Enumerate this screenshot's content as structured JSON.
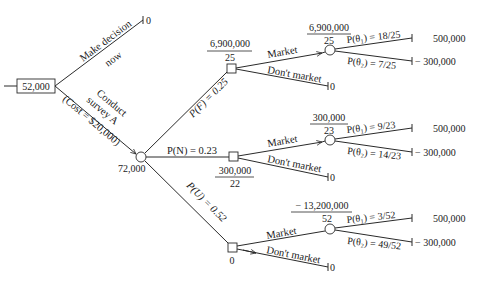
{
  "diagram": {
    "type": "decision-tree",
    "root": {
      "value": "52,000"
    },
    "make_decision_now": {
      "label_line1": "Make decision",
      "label_line2": "now",
      "payoff": "0"
    },
    "conduct_survey": {
      "label_line1": "Conduct",
      "label_line2": "survey A",
      "label_line3": "(Cost = $20,000)",
      "node_value": "72,000"
    },
    "branches": [
      {
        "prob_label": "P(F) = 0.25",
        "decision_value_num": "6,900,000",
        "decision_value_den": "25",
        "market_label": "Market",
        "dont_market_label": "Don't market",
        "dont_market_payoff": "0",
        "chance_value_num": "6,900,000",
        "chance_value_den": "25",
        "theta1_label": "P(θ₁) = 18/25",
        "theta2_label": "P(θ₂) = 7/25",
        "payoff1": "500,000",
        "payoff2": "− 300,000"
      },
      {
        "prob_label": "P(N) = 0.23",
        "decision_value_num": "300,000",
        "decision_value_den": "22",
        "market_label": "Market",
        "dont_market_label": "Don't market",
        "dont_market_payoff": "0",
        "chance_value_num": "300,000",
        "chance_value_den": "23",
        "theta1_label": "P(θ₁) = 9/23",
        "theta2_label": "P(θ₂) = 14/23",
        "payoff1": "500,000",
        "payoff2": "− 300,000"
      },
      {
        "prob_label": "P(U) = 0.52",
        "decision_value": "0",
        "market_label": "Market",
        "dont_market_label": "Don't market",
        "dont_market_payoff": "0",
        "chance_value_num": "− 13,200,000",
        "chance_value_den": "52",
        "theta1_label": "P(θ₁) = 3/52",
        "theta2_label": "P(θ₂) = 49/52",
        "payoff1": "500,000",
        "payoff2": "− 300,000"
      }
    ]
  },
  "colors": {
    "line": "#2a2a2a",
    "text": "#1a1a1a",
    "background": "#ffffff"
  }
}
